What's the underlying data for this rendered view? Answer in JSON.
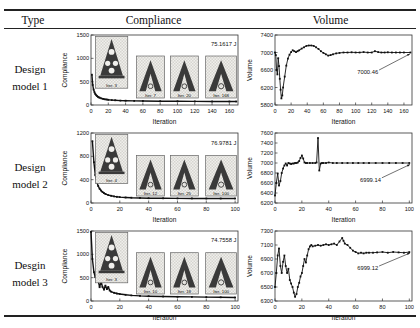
{
  "table": {
    "header": {
      "type": "Type",
      "compliance": "Compliance",
      "volume": "Volume"
    },
    "rows": [
      {
        "type_line1": "Design",
        "type_line2": "model 1"
      },
      {
        "type_line1": "Design",
        "type_line2": "model 2"
      },
      {
        "type_line1": "Desgin",
        "type_line2": "model 3"
      }
    ]
  },
  "colors": {
    "line": "#111111",
    "axis": "#333333",
    "text": "#111111",
    "inset_bg": "#f0efec",
    "inset_checker": "#d6d5d0",
    "inset_border": "#666666",
    "shape": "#3a3a3a"
  },
  "chart_data": [
    {
      "type": "line",
      "row": "Design model 1",
      "kind": "compliance",
      "title": "",
      "xlabel": "Iteration",
      "ylabel": "Compliance",
      "xlim": [
        0,
        170
      ],
      "ylim": [
        0,
        1500
      ],
      "xticks": [
        0,
        20,
        40,
        60,
        80,
        100,
        120,
        140,
        160
      ],
      "yticks": [
        0,
        500,
        1000,
        1500
      ],
      "points": [
        [
          1,
          650
        ],
        [
          2,
          430
        ],
        [
          3,
          330
        ],
        [
          4,
          272
        ],
        [
          5,
          235
        ],
        [
          6,
          210
        ],
        [
          7,
          190
        ],
        [
          8,
          176
        ],
        [
          9,
          165
        ],
        [
          10,
          156
        ],
        [
          12,
          141
        ],
        [
          14,
          131
        ],
        [
          16,
          123
        ],
        [
          18,
          117
        ],
        [
          20,
          112
        ],
        [
          24,
          105
        ],
        [
          28,
          100
        ],
        [
          34,
          95
        ],
        [
          40,
          92
        ],
        [
          50,
          88
        ],
        [
          60,
          85
        ],
        [
          80,
          81
        ],
        [
          100,
          79
        ],
        [
          120,
          77
        ],
        [
          140,
          76
        ],
        [
          160,
          75.4
        ],
        [
          168,
          75.2
        ]
      ],
      "final_value": "75.1617 J",
      "annotation": {
        "text": "75.1617 J",
        "fx": 0.99,
        "fy": 0.15,
        "anchor": "end"
      },
      "insets": [
        {
          "label": "Iter. 3",
          "shape": "tree",
          "x": 0.03,
          "y": 0.02,
          "w": 0.22,
          "h": 0.74
        },
        {
          "label": "Iter. 7",
          "shape": "arch",
          "x": 0.31,
          "y": 0.3,
          "w": 0.19,
          "h": 0.6
        },
        {
          "label": "Iter. 20",
          "shape": "arch",
          "x": 0.54,
          "y": 0.3,
          "w": 0.19,
          "h": 0.6
        },
        {
          "label": "Iter. 168",
          "shape": "arch",
          "x": 0.78,
          "y": 0.3,
          "w": 0.21,
          "h": 0.6
        }
      ]
    },
    {
      "type": "line",
      "row": "Design model 1",
      "kind": "volume",
      "title": "",
      "xlabel": "Iteration",
      "ylabel": "Volume",
      "xlim": [
        0,
        170
      ],
      "ylim": [
        5800,
        7400
      ],
      "xticks": [
        0,
        20,
        40,
        60,
        80,
        100,
        120,
        140,
        160
      ],
      "yticks": [
        5800,
        6200,
        6600,
        7000,
        7400
      ],
      "points": [
        [
          0,
          7000
        ],
        [
          1,
          6940
        ],
        [
          2,
          6600
        ],
        [
          3,
          6500
        ],
        [
          4,
          6870
        ],
        [
          5,
          6690
        ],
        [
          6,
          6400
        ],
        [
          7,
          6150
        ],
        [
          8,
          5950
        ],
        [
          9,
          6020
        ],
        [
          10,
          6200
        ],
        [
          12,
          6450
        ],
        [
          14,
          6700
        ],
        [
          16,
          6860
        ],
        [
          18,
          6950
        ],
        [
          20,
          7010
        ],
        [
          22,
          7050
        ],
        [
          24,
          7030
        ],
        [
          26,
          7010
        ],
        [
          28,
          7030
        ],
        [
          30,
          7050
        ],
        [
          33,
          7090
        ],
        [
          36,
          7120
        ],
        [
          39,
          7150
        ],
        [
          42,
          7160
        ],
        [
          45,
          7160
        ],
        [
          48,
          7150
        ],
        [
          51,
          7120
        ],
        [
          54,
          7080
        ],
        [
          57,
          7030
        ],
        [
          60,
          6990
        ],
        [
          63,
          6960
        ],
        [
          66,
          6930
        ],
        [
          69,
          6940
        ],
        [
          72,
          6960
        ],
        [
          76,
          6980
        ],
        [
          80,
          6990
        ],
        [
          85,
          7000
        ],
        [
          90,
          7000
        ],
        [
          95,
          7005
        ],
        [
          100,
          7000
        ],
        [
          105,
          7000
        ],
        [
          110,
          7010
        ],
        [
          115,
          7000
        ],
        [
          120,
          7000
        ],
        [
          124,
          7030
        ],
        [
          128,
          7010
        ],
        [
          132,
          7000
        ],
        [
          136,
          7000
        ],
        [
          140,
          7005
        ],
        [
          145,
          7000
        ],
        [
          150,
          7000
        ],
        [
          155,
          7000
        ],
        [
          160,
          7000
        ],
        [
          168,
          7000.5
        ]
      ],
      "final_value": "7000.46",
      "annotation": {
        "text": "7000.46",
        "fx": 0.6,
        "fy": 0.56,
        "anchor": "start",
        "leader": [
          0.76,
          0.5,
          0.985,
          0.27
        ]
      },
      "insets": []
    },
    {
      "type": "line",
      "row": "Design model 2",
      "kind": "compliance",
      "title": "",
      "xlabel": "Iteration",
      "ylabel": "Compliance",
      "xlim": [
        0,
        102
      ],
      "ylim": [
        0,
        1200
      ],
      "xticks": [
        0,
        20,
        40,
        60,
        80,
        100
      ],
      "yticks": [
        0,
        400,
        800,
        1200
      ],
      "points": [
        [
          1,
          1060
        ],
        [
          2,
          700
        ],
        [
          3,
          480
        ],
        [
          4,
          360
        ],
        [
          5,
          292
        ],
        [
          6,
          245
        ],
        [
          7,
          212
        ],
        [
          8,
          188
        ],
        [
          9,
          170
        ],
        [
          10,
          156
        ],
        [
          12,
          136
        ],
        [
          14,
          123
        ],
        [
          16,
          113
        ],
        [
          18,
          106
        ],
        [
          20,
          101
        ],
        [
          24,
          94
        ],
        [
          28,
          90
        ],
        [
          34,
          86
        ],
        [
          40,
          83
        ],
        [
          50,
          80
        ],
        [
          60,
          79
        ],
        [
          70,
          78
        ],
        [
          80,
          77.5
        ],
        [
          90,
          77.2
        ],
        [
          100,
          77
        ]
      ],
      "final_value": "76.9781 J",
      "annotation": {
        "text": "76.9781 J",
        "fx": 0.99,
        "fy": 0.17,
        "anchor": "end"
      },
      "insets": [
        {
          "label": "Iter. 4",
          "shape": "tree",
          "x": 0.03,
          "y": 0.02,
          "w": 0.22,
          "h": 0.7
        },
        {
          "label": "Iter. 12",
          "shape": "arch",
          "x": 0.31,
          "y": 0.32,
          "w": 0.19,
          "h": 0.58
        },
        {
          "label": "Iter. 25",
          "shape": "arch",
          "x": 0.54,
          "y": 0.32,
          "w": 0.19,
          "h": 0.58
        },
        {
          "label": "Iter. 100",
          "shape": "arch",
          "x": 0.78,
          "y": 0.32,
          "w": 0.21,
          "h": 0.58
        }
      ]
    },
    {
      "type": "line",
      "row": "Design model 2",
      "kind": "volume",
      "title": "",
      "xlabel": "Iteration",
      "ylabel": "Volume",
      "xlim": [
        0,
        102
      ],
      "ylim": [
        6200,
        7600
      ],
      "xticks": [
        0,
        20,
        40,
        60,
        80,
        100
      ],
      "yticks": [
        6200,
        6400,
        6600,
        6800,
        7000,
        7200,
        7400,
        7600
      ],
      "points": [
        [
          0,
          6350
        ],
        [
          1,
          6600
        ],
        [
          2,
          6790
        ],
        [
          3,
          6550
        ],
        [
          4,
          6640
        ],
        [
          5,
          6800
        ],
        [
          6,
          6890
        ],
        [
          7,
          6950
        ],
        [
          8,
          6990
        ],
        [
          9,
          6950
        ],
        [
          10,
          7000
        ],
        [
          11,
          6990
        ],
        [
          12,
          6980
        ],
        [
          13,
          6990
        ],
        [
          14,
          6990
        ],
        [
          15,
          7000
        ],
        [
          16,
          7000
        ],
        [
          17,
          7010
        ],
        [
          18,
          7040
        ],
        [
          19,
          7100
        ],
        [
          20,
          7150
        ],
        [
          21,
          7090
        ],
        [
          22,
          7010
        ],
        [
          23,
          7000
        ],
        [
          24,
          7000
        ],
        [
          26,
          7000
        ],
        [
          28,
          7000
        ],
        [
          30,
          7000
        ],
        [
          31,
          7010
        ],
        [
          32,
          7500
        ],
        [
          33,
          6850
        ],
        [
          34,
          6990
        ],
        [
          35,
          7000
        ],
        [
          36,
          7000
        ],
        [
          38,
          7000
        ],
        [
          40,
          7010
        ],
        [
          43,
          7000
        ],
        [
          46,
          7000
        ],
        [
          50,
          7000
        ],
        [
          54,
          7000
        ],
        [
          58,
          7000
        ],
        [
          62,
          7000
        ],
        [
          66,
          7000
        ],
        [
          70,
          7000
        ],
        [
          75,
          7000
        ],
        [
          80,
          7000
        ],
        [
          85,
          7000
        ],
        [
          90,
          7000
        ],
        [
          95,
          7000
        ],
        [
          100,
          6999.1
        ]
      ],
      "final_value": "6999.14",
      "annotation": {
        "text": "6999.14",
        "fx": 0.62,
        "fy": 0.7,
        "anchor": "start",
        "leader": [
          0.78,
          0.64,
          0.985,
          0.45
        ]
      },
      "insets": []
    },
    {
      "type": "line",
      "row": "Desgin model 3",
      "kind": "compliance",
      "title": "",
      "xlabel": "Iteration",
      "ylabel": "Compliance",
      "xlim": [
        0,
        102
      ],
      "ylim": [
        0,
        1500
      ],
      "xticks": [
        0,
        20,
        40,
        60,
        80,
        100
      ],
      "yticks": [
        0,
        500,
        1000,
        1500
      ],
      "points": [
        [
          0,
          1480
        ],
        [
          1,
          900
        ],
        [
          2,
          620
        ],
        [
          3,
          510
        ],
        [
          4,
          555
        ],
        [
          5,
          430
        ],
        [
          6,
          295
        ],
        [
          7,
          420
        ],
        [
          8,
          300
        ],
        [
          9,
          245
        ],
        [
          10,
          330
        ],
        [
          11,
          255
        ],
        [
          12,
          300
        ],
        [
          13,
          225
        ],
        [
          14,
          200
        ],
        [
          16,
          175
        ],
        [
          18,
          160
        ],
        [
          20,
          150
        ],
        [
          24,
          132
        ],
        [
          28,
          120
        ],
        [
          34,
          110
        ],
        [
          40,
          103
        ],
        [
          50,
          96
        ],
        [
          60,
          91
        ],
        [
          70,
          87
        ],
        [
          80,
          83
        ],
        [
          90,
          79
        ],
        [
          100,
          75
        ]
      ],
      "final_value": "74.7558 J",
      "annotation": {
        "text": "74.7558 J",
        "fx": 0.99,
        "fy": 0.15,
        "anchor": "end"
      },
      "insets": [
        {
          "label": "Iter. 3",
          "shape": "tree",
          "x": 0.03,
          "y": 0.02,
          "w": 0.22,
          "h": 0.72
        },
        {
          "label": "Iter. 10",
          "shape": "arch",
          "x": 0.31,
          "y": 0.31,
          "w": 0.19,
          "h": 0.59
        },
        {
          "label": "Iter. 18",
          "shape": "arch",
          "x": 0.54,
          "y": 0.31,
          "w": 0.19,
          "h": 0.59
        },
        {
          "label": "Iter. 100",
          "shape": "arch",
          "x": 0.78,
          "y": 0.31,
          "w": 0.21,
          "h": 0.59
        }
      ]
    },
    {
      "type": "line",
      "row": "Desgin model 3",
      "kind": "volume",
      "title": "",
      "xlabel": "Iteration",
      "ylabel": "Volume",
      "xlim": [
        0,
        102
      ],
      "ylim": [
        6300,
        7300
      ],
      "xticks": [
        0,
        20,
        40,
        60,
        80,
        100
      ],
      "yticks": [
        6300,
        6500,
        6700,
        6900,
        7100,
        7300
      ],
      "points": [
        [
          0,
          6500
        ],
        [
          1,
          6700
        ],
        [
          2,
          6950
        ],
        [
          3,
          7050
        ],
        [
          4,
          6800
        ],
        [
          5,
          6700
        ],
        [
          6,
          6860
        ],
        [
          7,
          6950
        ],
        [
          8,
          6800
        ],
        [
          9,
          6700
        ],
        [
          10,
          6760
        ],
        [
          11,
          6600
        ],
        [
          12,
          6550
        ],
        [
          13,
          6500
        ],
        [
          14,
          6420
        ],
        [
          15,
          6360
        ],
        [
          16,
          6400
        ],
        [
          17,
          6500
        ],
        [
          18,
          6560
        ],
        [
          19,
          6650
        ],
        [
          20,
          6700
        ],
        [
          21,
          6800
        ],
        [
          22,
          6900
        ],
        [
          23,
          6850
        ],
        [
          24,
          6950
        ],
        [
          25,
          7040
        ],
        [
          26,
          7080
        ],
        [
          27,
          7100
        ],
        [
          28,
          7080
        ],
        [
          30,
          7090
        ],
        [
          32,
          7100
        ],
        [
          34,
          7090
        ],
        [
          36,
          7100
        ],
        [
          38,
          7110
        ],
        [
          40,
          7100
        ],
        [
          42,
          7110
        ],
        [
          44,
          7120
        ],
        [
          46,
          7100
        ],
        [
          48,
          7150
        ],
        [
          50,
          7200
        ],
        [
          51,
          7160
        ],
        [
          52,
          7120
        ],
        [
          54,
          7100
        ],
        [
          56,
          7060
        ],
        [
          58,
          7020
        ],
        [
          60,
          7000
        ],
        [
          62,
          6980
        ],
        [
          64,
          6990
        ],
        [
          66,
          6980
        ],
        [
          68,
          6990
        ],
        [
          70,
          6990
        ],
        [
          73,
          6990
        ],
        [
          76,
          6995
        ],
        [
          80,
          7000
        ],
        [
          84,
          6990
        ],
        [
          88,
          7000
        ],
        [
          92,
          6995
        ],
        [
          96,
          6990
        ],
        [
          100,
          6999.1
        ]
      ],
      "final_value": "6999.12",
      "annotation": {
        "text": "6999.12",
        "fx": 0.6,
        "fy": 0.56,
        "anchor": "start",
        "leader": [
          0.76,
          0.5,
          0.985,
          0.315
        ]
      },
      "insets": []
    }
  ]
}
